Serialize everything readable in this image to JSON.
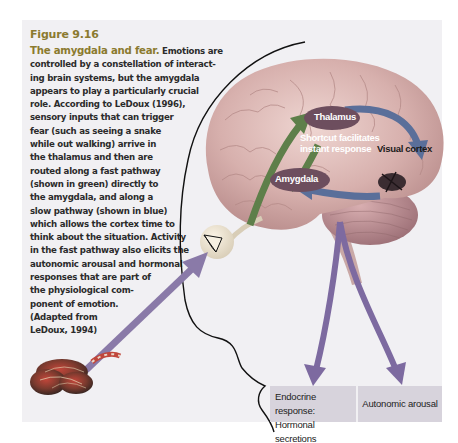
{
  "figure": {
    "number": "Figure 9.16",
    "title": "The amygdala and fear.",
    "caption_lines": [
      " Emotions are",
      "controlled by a constellation of interact-",
      "ing brain systems, but the amygdala",
      "appears to play a particularly crucial",
      "role. According to LeDoux (1996),",
      "sensory inputs that can trigger",
      "fear (such as seeing a snake",
      "while out walking) arrive in",
      "the thalamus and then are",
      "routed along a fast pathway",
      "(shown in green) directly to",
      "the amygdala, and along a",
      "slow pathway (shown in blue)",
      "which allows the cortex time to",
      "think about the situation. Activity",
      "in the fast pathway also elicits the",
      "autonomic arousal and hormonal",
      "responses that are part of",
      "the physiological com-",
      "ponent of emotion.",
      "(Adapted from",
      "LeDoux, 1994)"
    ]
  },
  "diagram": {
    "labels": {
      "thalamus": "Thalamus",
      "shortcut_line1": "Shortcut facilitates",
      "shortcut_line2": "instant response",
      "visual_cortex": "Visual cortex",
      "amygdala": "Amygdala"
    },
    "responses": {
      "endocrine_line1": "Endocrine response:",
      "endocrine_line2": "Hormonal secretions",
      "autonomic": "Autonomic arousal"
    },
    "colors": {
      "panel_bg": "#f1f0f3",
      "title": "#8b7a2f",
      "fast_pathway": "#5e7f4a",
      "slow_pathway": "#5a6f9a",
      "output_arrows": "#7d6aa0",
      "input_arrow": "#8a7aa8",
      "node_ellipse": "#6d4e5e",
      "response_box": "#d7d3dc",
      "brain": "#d9b7b4"
    }
  }
}
